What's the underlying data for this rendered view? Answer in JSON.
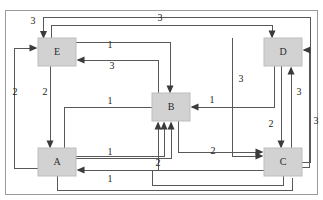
{
  "diagram": {
    "type": "directed-weighted-graph",
    "title": "",
    "canvas": {
      "width": 323,
      "height": 200,
      "background": "#ffffff"
    },
    "node_style": {
      "fill": "#d2d2d2",
      "stroke": "#bdbdbd"
    },
    "edge_style": {
      "stroke": "#58585a",
      "arrow_fill": "#3b3b3d"
    },
    "nodes": [
      {
        "id": "E",
        "label": "E",
        "x": 38,
        "y": 38,
        "w": 38,
        "h": 28,
        "cx": 57,
        "cy": 52
      },
      {
        "id": "D",
        "label": "D",
        "x": 264,
        "y": 38,
        "w": 38,
        "h": 28,
        "cx": 283,
        "cy": 52
      },
      {
        "id": "B",
        "label": "B",
        "x": 152,
        "y": 93,
        "w": 38,
        "h": 28,
        "cx": 171,
        "cy": 107
      },
      {
        "id": "A",
        "label": "A",
        "x": 38,
        "y": 148,
        "w": 38,
        "h": 28,
        "cx": 57,
        "cy": 162
      },
      {
        "id": "C",
        "label": "C",
        "x": 264,
        "y": 148,
        "w": 38,
        "h": 28,
        "cx": 283,
        "cy": 162
      }
    ],
    "edges": [
      {
        "id": "e1",
        "from": "C",
        "to": "E",
        "weight": "3",
        "label": "3",
        "label_x": 33,
        "label_y": 22
      },
      {
        "id": "e2",
        "from": "E",
        "to": "D",
        "weight": "3",
        "label": "3",
        "label_x": 160,
        "label_y": 19
      },
      {
        "id": "e3",
        "from": "E",
        "to": "B",
        "weight": "1",
        "label": "1",
        "label_x": 110,
        "label_y": 46
      },
      {
        "id": "e4",
        "from": "B",
        "to": "E",
        "weight": "3",
        "label": "3",
        "label_x": 112,
        "label_y": 66
      },
      {
        "id": "e5",
        "from": "A",
        "to": "E",
        "weight": "2",
        "label": "2",
        "label_x": 15,
        "label_y": 93
      },
      {
        "id": "e6",
        "from": "E",
        "to": "A",
        "weight": "2",
        "label": "2",
        "label_x": 45,
        "label_y": 93
      },
      {
        "id": "e7",
        "from": "D",
        "to": "B",
        "weight": "1",
        "label": "1",
        "label_x": 212,
        "label_y": 101
      },
      {
        "id": "e8",
        "from": "D",
        "to": "C",
        "weight": "3",
        "label": "3",
        "label_x": 240,
        "label_y": 80
      },
      {
        "id": "e9",
        "from": "D",
        "to": "C",
        "weight": "2",
        "label": "2",
        "label_x": 270,
        "label_y": 125
      },
      {
        "id": "e10",
        "from": "C",
        "to": "D",
        "weight": "3",
        "label": "3",
        "label_x": 299,
        "label_y": 93
      },
      {
        "id": "e11",
        "from": "C",
        "to": "D",
        "weight": "3",
        "label": "3",
        "label_x": 316,
        "label_y": 122
      },
      {
        "id": "e12",
        "from": "A",
        "to": "B",
        "weight": "1",
        "label": "1",
        "label_x": 110,
        "label_y": 102
      },
      {
        "id": "e13",
        "from": "A",
        "to": "B",
        "weight": "1",
        "label": "1",
        "label_x": 110,
        "label_y": 153
      },
      {
        "id": "e14",
        "from": "B",
        "to": "C",
        "weight": "2",
        "label": "2",
        "label_x": 213,
        "label_y": 153
      },
      {
        "id": "e15",
        "from": "C",
        "to": "B",
        "weight": "2",
        "label": "2",
        "label_x": 158,
        "label_y": 164
      },
      {
        "id": "e16",
        "from": "C",
        "to": "A",
        "weight": "1",
        "label": "1",
        "label_x": 110,
        "label_y": 180
      }
    ],
    "weights_present": [
      "1",
      "2",
      "3"
    ]
  }
}
